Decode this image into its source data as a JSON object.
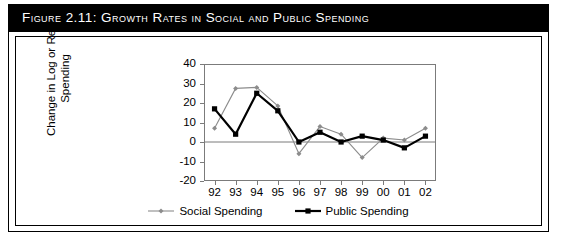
{
  "figure": {
    "title": "Figure 2.11:  Growth Rates in Social and Public Spending"
  },
  "chart_data": {
    "type": "line",
    "title": "",
    "xlabel": "",
    "ylabel": "Change in Log or Real Spending",
    "categories": [
      "92",
      "93",
      "94",
      "95",
      "96",
      "97",
      "98",
      "99",
      "00",
      "01",
      "02"
    ],
    "yticks": [
      "40",
      "30",
      "20",
      "10",
      "0",
      "-10",
      "-20"
    ],
    "ylim": [
      -20,
      40
    ],
    "grid": false,
    "zero_line": true,
    "legend_position": "bottom",
    "series": [
      {
        "name": "Social Spending",
        "color": "#8c8c8c",
        "marker": "diamond",
        "values": [
          7,
          27.5,
          28,
          18.5,
          -6,
          8,
          4,
          -8,
          2,
          1,
          7
        ]
      },
      {
        "name": "Public Spending",
        "color": "#000000",
        "marker": "square",
        "values": [
          17,
          4,
          25,
          16,
          0,
          5,
          0,
          3,
          1,
          -3,
          3
        ]
      }
    ]
  }
}
